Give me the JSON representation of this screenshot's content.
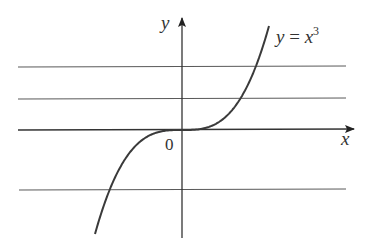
{
  "diagram": {
    "axis_labels": {
      "x": "x",
      "y": "y",
      "origin": "0"
    },
    "curve_label": {
      "lhs": "y",
      "eq": " = ",
      "base": "x",
      "exponent": "3"
    },
    "horizontal_lines_y_px": [
      67,
      99,
      130,
      190
    ],
    "colors": {
      "curve": "#3a3a3a",
      "lines": "#5a5a5a",
      "axis": "#333333",
      "background": "#ffffff"
    }
  }
}
